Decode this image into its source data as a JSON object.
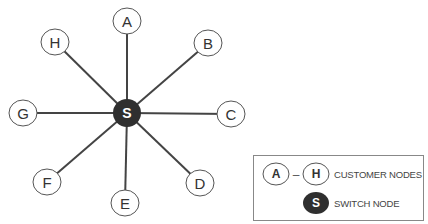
{
  "diagram": {
    "type": "star-network",
    "center": {
      "id": "S",
      "label": "S",
      "x": 127,
      "y": 113,
      "r": 14,
      "fill": "#2f2f2f"
    },
    "nodes": [
      {
        "id": "A",
        "label": "A",
        "x": 127,
        "y": 21
      },
      {
        "id": "B",
        "label": "B",
        "x": 208,
        "y": 43
      },
      {
        "id": "C",
        "label": "C",
        "x": 231,
        "y": 114
      },
      {
        "id": "D",
        "label": "D",
        "x": 200,
        "y": 183
      },
      {
        "id": "E",
        "label": "E",
        "x": 125,
        "y": 203
      },
      {
        "id": "F",
        "label": "F",
        "x": 47,
        "y": 182
      },
      {
        "id": "G",
        "label": "G",
        "x": 23,
        "y": 113
      },
      {
        "id": "H",
        "label": "H",
        "x": 55,
        "y": 42
      }
    ],
    "node_radius": 13,
    "edge_color": "#444444",
    "node_stroke": "#555555"
  },
  "legend": {
    "customer": {
      "from": "A",
      "dash": "–",
      "to": "H",
      "label": "CUSTOMER NODES"
    },
    "switch": {
      "symbol": "S",
      "label": "SWITCH NODE"
    }
  }
}
